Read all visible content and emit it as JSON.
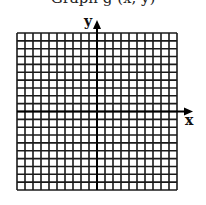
{
  "header": {
    "partial_text": "Graph g (x, y)"
  },
  "grid": {
    "columns": 20,
    "rows": 20,
    "left": 17,
    "top": 33,
    "width": 160,
    "height": 157,
    "line_color": "#1a1a1a"
  },
  "axes": {
    "x_label": "x",
    "y_label": "y",
    "origin": {
      "x": 97,
      "y": 111.5
    },
    "x_arrow_end": 193,
    "y_arrow_end": 20,
    "color": "#000000"
  },
  "chart_data": {
    "type": "scatter",
    "title": "",
    "xlabel": "x",
    "ylabel": "y",
    "grid": true,
    "grid_cells": {
      "columns": 20,
      "rows": 20
    },
    "xlim": [
      -10,
      10
    ],
    "ylim": [
      -10,
      10
    ],
    "series": []
  }
}
